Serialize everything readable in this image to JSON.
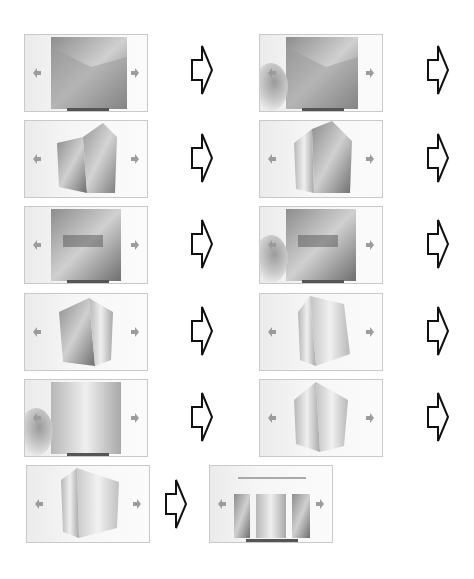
{
  "figure": {
    "colors": {
      "frame_border": "#c9c9c9",
      "nav_arrow": "#9c9c9c",
      "flow_arrow": "#111111",
      "background": "#ffffff"
    },
    "frames": [
      {
        "id": 1,
        "state": "flat-photo",
        "touch": false
      },
      {
        "id": 2,
        "state": "flat-photo",
        "touch": true
      },
      {
        "id": 3,
        "state": "cube-rotating",
        "touch": false
      },
      {
        "id": 4,
        "state": "cube-rotating",
        "touch": false
      },
      {
        "id": 5,
        "state": "flat-photo",
        "touch": false
      },
      {
        "id": 6,
        "state": "flat-photo",
        "touch": true
      },
      {
        "id": 7,
        "state": "cube-rotating",
        "touch": false
      },
      {
        "id": 8,
        "state": "cube-rotating",
        "touch": false
      },
      {
        "id": 9,
        "state": "flat-photo",
        "touch": true
      },
      {
        "id": 10,
        "state": "cube-rotating",
        "touch": false
      },
      {
        "id": 11,
        "state": "cube-rotating",
        "touch": false
      },
      {
        "id": 12,
        "state": "flat-photo-gate",
        "touch": false
      }
    ],
    "icons": {
      "nav_left": "left-arrow-icon",
      "nav_right": "right-arrow-icon",
      "flow": "block-right-arrow-icon"
    }
  }
}
